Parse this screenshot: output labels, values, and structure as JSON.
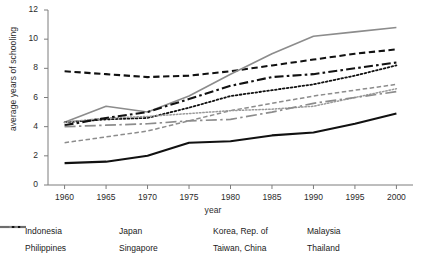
{
  "chart_data": {
    "type": "line",
    "title": "",
    "xlabel": "year",
    "ylabel": "average years of schooling",
    "x": [
      1960,
      1965,
      1970,
      1975,
      1980,
      1985,
      1990,
      1995,
      2000
    ],
    "xlim": [
      1958,
      2002
    ],
    "ylim": [
      0,
      12
    ],
    "xticks": [
      1960,
      1965,
      1970,
      1975,
      1980,
      1985,
      1990,
      1995,
      2000
    ],
    "yticks": [
      0,
      2,
      4,
      6,
      8,
      10,
      12
    ],
    "grid": false,
    "legend_position": "bottom",
    "series": [
      {
        "name": "Indonesia",
        "style": "solid",
        "color": "#111111",
        "width": 2.1,
        "values": [
          1.5,
          1.6,
          2.0,
          2.9,
          3.0,
          3.4,
          3.6,
          4.2,
          4.9
        ]
      },
      {
        "name": "Japan",
        "style": "dashed",
        "color": "#111111",
        "width": 2.1,
        "values": [
          7.8,
          7.6,
          7.4,
          7.5,
          7.8,
          8.2,
          8.6,
          9.0,
          9.3
        ]
      },
      {
        "name": "Korea, Rep. of",
        "style": "solid",
        "color": "#8c8c8c",
        "width": 1.6,
        "values": [
          4.3,
          5.4,
          5.0,
          6.1,
          7.6,
          9.0,
          10.2,
          10.5,
          10.8
        ]
      },
      {
        "name": "Malaysia",
        "style": "dashed",
        "color": "#8c8c8c",
        "width": 1.5,
        "values": [
          2.9,
          3.3,
          3.7,
          4.4,
          5.1,
          5.6,
          6.1,
          6.5,
          6.9
        ]
      },
      {
        "name": "Philippines",
        "style": "dotted",
        "color": "#111111",
        "width": 1.8,
        "values": [
          4.3,
          4.5,
          4.6,
          5.3,
          6.1,
          6.5,
          6.9,
          7.5,
          8.2
        ]
      },
      {
        "name": "Singapore",
        "style": "dotted",
        "color": "#9a9a9a",
        "width": 1.5,
        "values": [
          4.3,
          4.6,
          4.7,
          4.9,
          5.1,
          5.2,
          5.4,
          6.0,
          6.6
        ]
      },
      {
        "name": "Taiwan, China",
        "style": "dashdot",
        "color": "#111111",
        "width": 2.1,
        "values": [
          4.1,
          4.6,
          5.0,
          5.9,
          6.8,
          7.4,
          7.6,
          8.0,
          8.4
        ]
      },
      {
        "name": "Thailand",
        "style": "longdashdot",
        "color": "#8c8c8c",
        "width": 1.7,
        "values": [
          4.0,
          4.1,
          4.2,
          4.4,
          4.5,
          5.0,
          5.6,
          6.0,
          6.4
        ]
      }
    ],
    "legend": [
      [
        "Indonesia",
        "Japan",
        "Korea, Rep. of",
        "Malaysia"
      ],
      [
        "Philippines",
        "Singapore",
        "Taiwan, China",
        "Thailand"
      ]
    ]
  }
}
